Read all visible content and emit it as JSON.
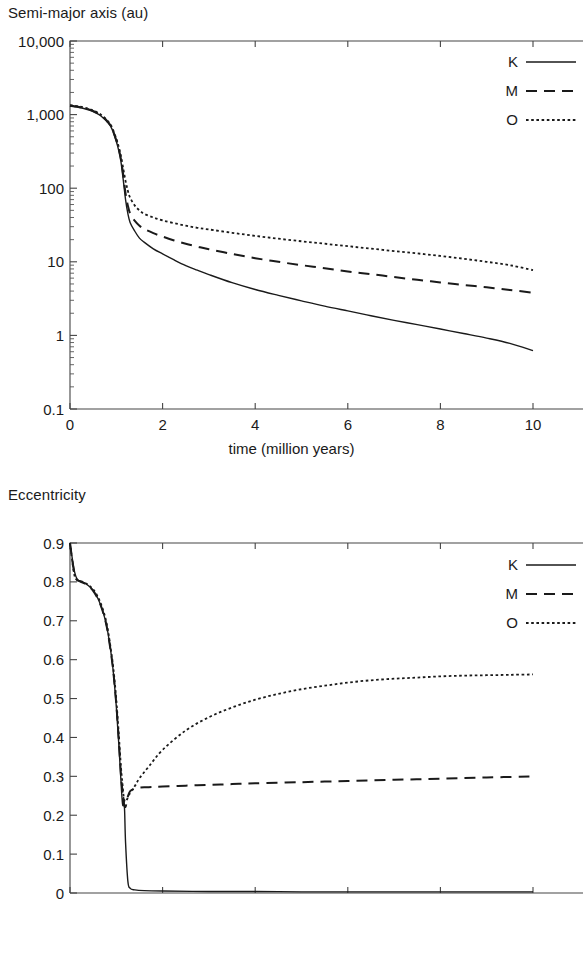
{
  "figures": [
    {
      "id": "semimajor",
      "ylabel": "Semi-major axis (au)",
      "xlabel": "time (million years)"
    },
    {
      "id": "eccentricity",
      "ylabel": "Eccentricity",
      "xlabel": "time (million years)"
    }
  ],
  "legend": {
    "entries": [
      {
        "label": "K",
        "style": "solid"
      },
      {
        "label": "M",
        "style": "dashed"
      },
      {
        "label": "O",
        "style": "dotted"
      }
    ]
  },
  "chart_data": [
    {
      "type": "line",
      "title": "",
      "ylabel": "Semi-major axis (au)",
      "xlabel": "time (million years)",
      "yscale": "log",
      "xscale": "linear",
      "xlim": [
        0,
        11
      ],
      "ylim": [
        0.1,
        10000
      ],
      "xticks": [
        0,
        2,
        4,
        6,
        8,
        10
      ],
      "xtick_labels": [
        "0",
        "2",
        "4",
        "6",
        "8",
        "10"
      ],
      "yticks": [
        0.1,
        1,
        10,
        100,
        1000,
        10000
      ],
      "ytick_labels": [
        "0.1",
        "1",
        "10",
        "100",
        "1,000",
        "10,000"
      ],
      "grid": false,
      "legend_position": "top-right",
      "series": [
        {
          "name": "K",
          "style": "solid",
          "x": [
            0,
            0.1,
            0.2,
            0.3,
            0.4,
            0.5,
            0.6,
            0.7,
            0.8,
            0.9,
            1.0,
            1.05,
            1.1,
            1.15,
            1.2,
            1.25,
            1.3,
            1.4,
            1.5,
            1.6,
            1.8,
            2.0,
            2.25,
            2.5,
            2.75,
            3.0,
            3.5,
            4.0,
            4.5,
            5.0,
            5.5,
            6.0,
            6.5,
            7.0,
            7.5,
            8.0,
            8.5,
            9.0,
            9.5,
            10.0
          ],
          "y": [
            1300,
            1280,
            1250,
            1210,
            1160,
            1100,
            1020,
            920,
            800,
            650,
            430,
            330,
            230,
            130,
            70,
            45,
            34,
            26,
            21,
            18.5,
            15,
            12.8,
            10.6,
            8.9,
            7.7,
            6.7,
            5.2,
            4.2,
            3.5,
            2.95,
            2.5,
            2.15,
            1.85,
            1.6,
            1.4,
            1.22,
            1.06,
            0.92,
            0.78,
            0.62
          ]
        },
        {
          "name": "M",
          "style": "dashed",
          "x": [
            0,
            0.1,
            0.2,
            0.3,
            0.4,
            0.5,
            0.6,
            0.7,
            0.8,
            0.9,
            1.0,
            1.05,
            1.1,
            1.15,
            1.2,
            1.25,
            1.3,
            1.4,
            1.5,
            1.6,
            1.8,
            2.0,
            2.25,
            2.5,
            2.75,
            3.0,
            3.5,
            4.0,
            4.5,
            5.0,
            5.5,
            6.0,
            6.5,
            7.0,
            7.5,
            8.0,
            8.5,
            9.0,
            9.5,
            10.0
          ],
          "y": [
            1320,
            1300,
            1270,
            1230,
            1180,
            1120,
            1040,
            940,
            820,
            670,
            450,
            350,
            250,
            150,
            85,
            58,
            45,
            36,
            31,
            28,
            24.5,
            22,
            19.5,
            17.6,
            16.1,
            14.8,
            12.8,
            11.2,
            10.0,
            9.0,
            8.2,
            7.4,
            6.8,
            6.2,
            5.7,
            5.25,
            4.85,
            4.5,
            4.15,
            3.8
          ]
        },
        {
          "name": "O",
          "style": "dotted",
          "x": [
            0,
            0.1,
            0.2,
            0.3,
            0.4,
            0.5,
            0.6,
            0.7,
            0.8,
            0.9,
            1.0,
            1.05,
            1.1,
            1.15,
            1.2,
            1.25,
            1.3,
            1.4,
            1.5,
            1.6,
            1.8,
            2.0,
            2.25,
            2.5,
            2.75,
            3.0,
            3.5,
            4.0,
            4.5,
            5.0,
            5.5,
            6.0,
            6.5,
            7.0,
            7.5,
            8.0,
            8.5,
            9.0,
            9.5,
            10.0
          ],
          "y": [
            1340,
            1320,
            1290,
            1250,
            1200,
            1140,
            1060,
            960,
            840,
            690,
            470,
            370,
            275,
            185,
            125,
            92,
            74,
            58,
            50,
            45,
            40,
            36.5,
            33.5,
            31,
            29,
            27.5,
            24.8,
            22.5,
            20.6,
            19.0,
            17.6,
            16.3,
            15.1,
            14.0,
            13.0,
            12.0,
            11.0,
            10.0,
            9.0,
            7.7
          ]
        }
      ]
    },
    {
      "type": "line",
      "title": "",
      "ylabel": "Eccentricity",
      "xlabel": "time (million years)",
      "yscale": "linear",
      "xscale": "linear",
      "xlim": [
        0,
        11
      ],
      "ylim": [
        0,
        0.9
      ],
      "xticks": [
        0,
        2,
        4,
        6,
        8,
        10
      ],
      "xtick_labels": [
        "0",
        "2",
        "4",
        "6",
        "8",
        "10"
      ],
      "yticks": [
        0,
        0.1,
        0.2,
        0.3,
        0.4,
        0.5,
        0.6,
        0.7,
        0.8,
        0.9
      ],
      "ytick_labels": [
        "0",
        "0.1",
        "0.2",
        "0.3",
        "0.4",
        "0.5",
        "0.6",
        "0.7",
        "0.8",
        "0.9"
      ],
      "grid": false,
      "legend_position": "top-right",
      "series": [
        {
          "name": "K",
          "style": "solid",
          "x": [
            0,
            0.05,
            0.1,
            0.15,
            0.2,
            0.3,
            0.4,
            0.5,
            0.6,
            0.7,
            0.8,
            0.9,
            0.95,
            1.0,
            1.05,
            1.1,
            1.12,
            1.14,
            1.16,
            1.18,
            1.2,
            1.25,
            1.3,
            1.4,
            1.6,
            2.0,
            3.0,
            4.0,
            5.0,
            6.0,
            7.0,
            8.0,
            9.0,
            10.0
          ],
          "y": [
            0.9,
            0.86,
            0.825,
            0.808,
            0.803,
            0.798,
            0.79,
            0.778,
            0.758,
            0.728,
            0.682,
            0.605,
            0.55,
            0.48,
            0.39,
            0.29,
            0.25,
            0.225,
            0.245,
            0.21,
            0.13,
            0.03,
            0.012,
            0.008,
            0.006,
            0.005,
            0.004,
            0.004,
            0.003,
            0.003,
            0.003,
            0.003,
            0.003,
            0.003
          ]
        },
        {
          "name": "M",
          "style": "dashed",
          "x": [
            0,
            0.05,
            0.1,
            0.15,
            0.2,
            0.3,
            0.4,
            0.5,
            0.6,
            0.7,
            0.8,
            0.9,
            0.95,
            1.0,
            1.05,
            1.1,
            1.13,
            1.16,
            1.2,
            1.25,
            1.3,
            1.4,
            1.5,
            1.7,
            2.0,
            2.5,
            3.0,
            3.5,
            4.0,
            5.0,
            6.0,
            7.0,
            8.0,
            9.0,
            10.0
          ],
          "y": [
            0.9,
            0.855,
            0.818,
            0.805,
            0.802,
            0.797,
            0.789,
            0.777,
            0.757,
            0.727,
            0.681,
            0.604,
            0.552,
            0.485,
            0.4,
            0.305,
            0.265,
            0.23,
            0.222,
            0.248,
            0.262,
            0.268,
            0.271,
            0.272,
            0.274,
            0.276,
            0.278,
            0.28,
            0.282,
            0.285,
            0.288,
            0.291,
            0.294,
            0.297,
            0.3
          ]
        },
        {
          "name": "O",
          "style": "dotted",
          "x": [
            0,
            0.05,
            0.1,
            0.15,
            0.2,
            0.3,
            0.4,
            0.5,
            0.6,
            0.7,
            0.8,
            0.9,
            0.95,
            1.0,
            1.05,
            1.1,
            1.13,
            1.16,
            1.2,
            1.3,
            1.4,
            1.5,
            1.7,
            2.0,
            2.5,
            3.0,
            3.5,
            4.0,
            4.5,
            5.0,
            5.5,
            6.0,
            6.5,
            7.0,
            7.5,
            8.0,
            8.5,
            9.0,
            9.5,
            10.0
          ],
          "y": [
            0.9,
            0.852,
            0.815,
            0.806,
            0.803,
            0.799,
            0.792,
            0.781,
            0.762,
            0.733,
            0.688,
            0.612,
            0.562,
            0.497,
            0.415,
            0.325,
            0.285,
            0.248,
            0.235,
            0.258,
            0.275,
            0.295,
            0.325,
            0.368,
            0.418,
            0.452,
            0.477,
            0.497,
            0.512,
            0.524,
            0.533,
            0.541,
            0.547,
            0.551,
            0.554,
            0.557,
            0.559,
            0.56,
            0.561,
            0.562
          ]
        }
      ]
    }
  ]
}
